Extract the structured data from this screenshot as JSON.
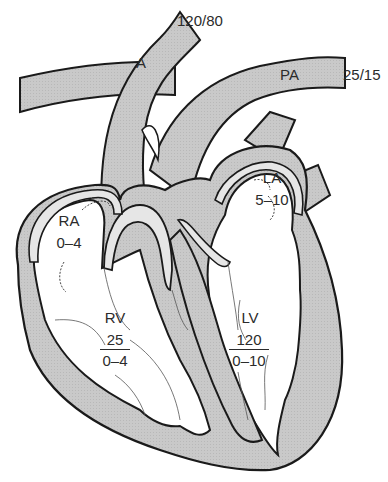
{
  "diagram": {
    "type": "heart-cross-section-pressures",
    "colors": {
      "fill": "#c8c8c8",
      "outline": "#1a1a1a",
      "background": "#ffffff",
      "text": "#2b2b2b"
    },
    "vessels": {
      "aorta": {
        "label": "A",
        "pressure": "120/80"
      },
      "pulmonary_artery": {
        "label": "PA",
        "pressure": "25/15"
      }
    },
    "chambers": {
      "right_atrium": {
        "label": "RA",
        "pressure": "0–4"
      },
      "left_atrium": {
        "label": "LA",
        "pressure": "5–10"
      },
      "right_ventricle": {
        "label": "RV",
        "systolic": "25",
        "diastolic": "0–4"
      },
      "left_ventricle": {
        "label": "LV",
        "systolic": "120",
        "diastolic": "0–10"
      }
    }
  }
}
